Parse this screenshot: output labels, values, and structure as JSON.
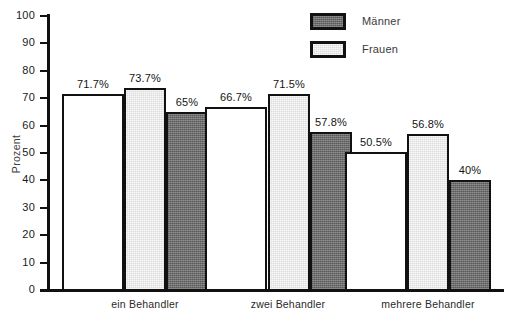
{
  "chart_data": {
    "type": "bar",
    "title": "",
    "subtitle": "",
    "xlabel": "",
    "ylabel": "Prozent",
    "ylim": [
      0,
      100
    ],
    "ytick_step": 10,
    "yticks": [
      "0",
      "10",
      "20",
      "30",
      "40",
      "50",
      "60",
      "70",
      "80",
      "90",
      "100"
    ],
    "grid": false,
    "legend_position": "top-right",
    "categories": [
      "ein Behandler",
      "zwei Behandler",
      "mehrere Behandler"
    ],
    "series": [
      {
        "name": "Gesamt",
        "fill": "white",
        "values": [
          71.7,
          66.7,
          50.5
        ],
        "labels": [
          "71.7%",
          "66.7%",
          "50.5%"
        ]
      },
      {
        "name": "Frauen",
        "fill": "light",
        "values": [
          73.7,
          71.5,
          56.8
        ],
        "labels": [
          "73.7%",
          "71.5%",
          "56.8%"
        ]
      },
      {
        "name": "Männer",
        "fill": "dark",
        "values": [
          65,
          57.8,
          40
        ],
        "labels": [
          "65%",
          "57.8%",
          "40%"
        ]
      }
    ]
  },
  "legend": {
    "items": [
      {
        "label": "Männer",
        "fill": "dark"
      },
      {
        "label": "Frauen",
        "fill": "light"
      }
    ]
  },
  "colors": {
    "axis": "#111111",
    "bar_outline": "#111111",
    "fill_white": "#ffffff",
    "fill_light": "#dcdcdc",
    "fill_dark": "#6d6d6d",
    "text": "#1a1a1a",
    "background": "#ffffff"
  }
}
